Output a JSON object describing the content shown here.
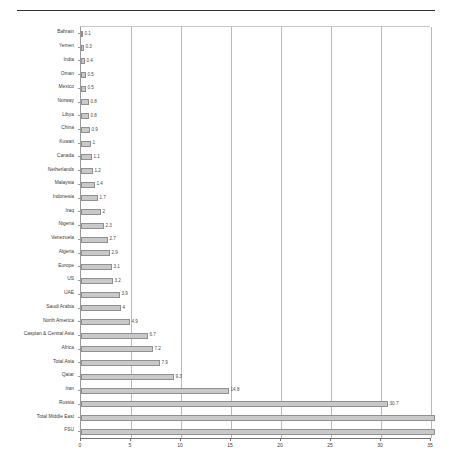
{
  "chart_data": {
    "type": "bar",
    "orientation": "horizontal",
    "title": "",
    "xlabel": "",
    "ylabel": "",
    "xlim": [
      0,
      35
    ],
    "xticks": [
      0,
      5,
      10,
      15,
      20,
      25,
      30,
      35
    ],
    "grid": true,
    "legend": null,
    "bar_fill": "#c9c9c9",
    "bar_border": "#8f8f8f",
    "categories": [
      "Bahrain",
      "Yemen",
      "India",
      "Oman",
      "Mexico",
      "Norway",
      "Libya",
      "China",
      "Kuwait",
      "Canada",
      "Netherlands",
      "Malaysia",
      "Indonesia",
      "Iraq",
      "Nigeria",
      "Venezuela",
      "Algeria",
      "Europe",
      "US",
      "UAE",
      "Saudi Arabia",
      "North America",
      "Caspian & Central Asia",
      "Africa",
      "Total Asia",
      "Qatar",
      "Iran",
      "Russia",
      "Total Middle East",
      "FSU"
    ],
    "values": [
      0.1,
      0.3,
      0.4,
      0.5,
      0.5,
      0.8,
      0.8,
      0.9,
      1,
      1.1,
      1.2,
      1.4,
      1.7,
      2,
      2.3,
      2.7,
      2.9,
      3.1,
      3.2,
      3.9,
      4,
      4.9,
      6.7,
      7.2,
      7.9,
      9.3,
      14.8,
      30.7,
      35.5,
      35.5
    ],
    "labels": [
      "0.1",
      "0.3",
      "0.4",
      "0.5",
      "0.5",
      "0.8",
      "0.8",
      "0.9",
      "1",
      "1.1",
      "1.2",
      "1.4",
      "1.7",
      "2",
      "2.3",
      "2.7",
      "2.9",
      "3.1",
      "3.2",
      "3.9",
      "4",
      "4.9",
      "6.7",
      "7.2",
      "7.9",
      "9.3",
      "14.8",
      "30.7",
      "",
      ""
    ]
  }
}
